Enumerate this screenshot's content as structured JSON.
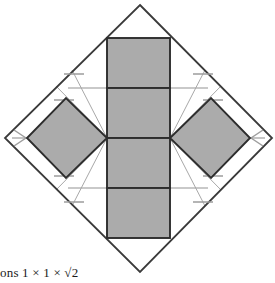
{
  "figure": {
    "title_visible": false,
    "caption_text": "ons 1 × 1 × √2",
    "colors": {
      "shape_fill": "#ababab",
      "shape_stroke": "#2d2d2d",
      "outer_diamond_stroke": "#3a3a3a",
      "construction_line": "#b4b4b4",
      "tick_mark": "#9a9a9a",
      "background": "#ffffff",
      "caption_color": "#1a1a1a"
    },
    "canvas": {
      "width": 275,
      "height": 283
    },
    "outer_diamond": {
      "name": "bounding-square-rotated-45",
      "vertices": [
        {
          "x": 140,
          "y": 5
        },
        {
          "x": 272,
          "y": 138
        },
        {
          "x": 140,
          "y": 272
        },
        {
          "x": 5,
          "y": 138
        }
      ],
      "stroke_width": 1.8
    },
    "central_column": {
      "name": "vertical-strip-of-four-rectangles",
      "left": 107,
      "right": 170,
      "top": 38,
      "bottom": 238,
      "divider_y": [
        88,
        138,
        188
      ],
      "cell_count": 4
    },
    "left_diamond": {
      "name": "left-rotated-square",
      "vertices": [
        {
          "x": 107,
          "y": 138
        },
        {
          "x": 66,
          "y": 98
        },
        {
          "x": 27,
          "y": 138
        },
        {
          "x": 66,
          "y": 178
        }
      ]
    },
    "right_diamond": {
      "name": "right-rotated-square",
      "vertices": [
        {
          "x": 170,
          "y": 138
        },
        {
          "x": 211,
          "y": 98
        },
        {
          "x": 250,
          "y": 138
        },
        {
          "x": 211,
          "y": 178
        }
      ]
    },
    "construction_lines": {
      "horizontal": [
        {
          "x1": 68,
          "y1": 88,
          "x2": 208,
          "y2": 88
        },
        {
          "x1": 68,
          "y1": 188,
          "x2": 208,
          "y2": 188
        },
        {
          "x1": 14,
          "y1": 138,
          "x2": 36,
          "y2": 138
        },
        {
          "x1": 241,
          "y1": 138,
          "x2": 263,
          "y2": 138
        }
      ],
      "diagonal": [
        {
          "x1": 107,
          "y1": 138,
          "x2": 74,
          "y2": 75
        },
        {
          "x1": 107,
          "y1": 138,
          "x2": 60,
          "y2": 90
        },
        {
          "x1": 107,
          "y1": 138,
          "x2": 74,
          "y2": 201
        },
        {
          "x1": 107,
          "y1": 138,
          "x2": 60,
          "y2": 186
        },
        {
          "x1": 170,
          "y1": 138,
          "x2": 203,
          "y2": 75
        },
        {
          "x1": 170,
          "y1": 138,
          "x2": 217,
          "y2": 90
        },
        {
          "x1": 170,
          "y1": 138,
          "x2": 203,
          "y2": 201
        },
        {
          "x1": 170,
          "y1": 138,
          "x2": 217,
          "y2": 186
        }
      ]
    },
    "tick_marks": {
      "count": 8,
      "description": "short angled hatch marks on the four slanted sides of the outer diamond near each quadrant"
    },
    "shape_count": {
      "rectangles": 4,
      "rotated_squares": 2,
      "total_faces": 6
    }
  }
}
